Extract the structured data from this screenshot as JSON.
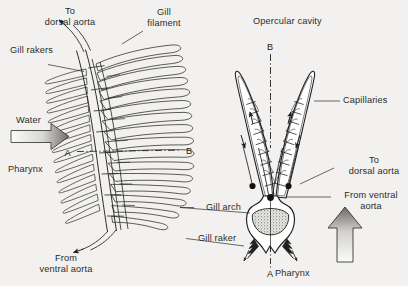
{
  "figure": {
    "title_alt": "Fish gill structure: lateral view of gill arch and transverse section A-B",
    "background_color": "#f2f1ef",
    "ink_color": "#1f1f1f"
  },
  "left_panel": {
    "name": "lateral-view-of-gill-arch",
    "labels": {
      "to_dorsal_aorta": "To\ndorsal aorta",
      "gill_filament": "Gill\nfilament",
      "gill_rakers": "Gill rakers",
      "water": "Water",
      "pharynx": "Pharynx",
      "from_ventral_aorta": "From\nventral aorta",
      "section_mark_a": "A",
      "section_mark_b": "B"
    }
  },
  "right_panel": {
    "name": "transverse-section-of-gill-arch",
    "labels": {
      "opercular_cavity": "Opercular cavity",
      "capillaries": "Capillaries",
      "to_dorsal_aorta": "To\ndorsal aorta",
      "from_ventral_aorta": "From ventral\naorta",
      "gill_arch": "Gill arch",
      "gill_raker": "Gill raker",
      "pharynx": "Pharynx",
      "section_mark_a": "A",
      "section_mark_b": "B"
    }
  }
}
